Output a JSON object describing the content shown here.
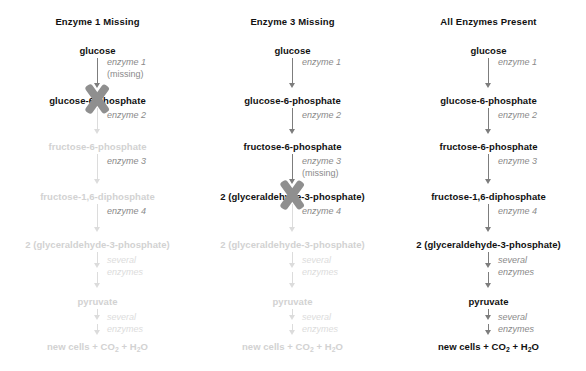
{
  "figure": {
    "background": "#ffffff",
    "active_color": "#111111",
    "faded_color": "#d2d2d2",
    "arrow_color": "#7d7d7d",
    "faded_arrow_color": "#dcdcdc",
    "x_mark_color": "#8f8f8f"
  },
  "columns": [
    {
      "title": "Enzyme 1 Missing",
      "blocked_at": "glucose-6-phosphate",
      "nodes": [
        {
          "label": "glucose",
          "faded": false
        },
        {
          "label": "glucose-6-phosphate",
          "faded": false,
          "x_mark": true
        },
        {
          "label": "fructose-6-phosphate",
          "faded": true
        },
        {
          "label": "fructose-1,6-diphosphate",
          "faded": true
        },
        {
          "label": "2 (glyceraldehyde-3-phosphate)",
          "faded": true
        },
        {
          "label": "pyruvate",
          "faded": true
        },
        {
          "label": "new cells + CO2 + H2O",
          "html": "new cells + CO<sub>2</sub> + H<sub>2</sub>O",
          "faded": true
        }
      ],
      "steps": [
        {
          "label": "enzyme 1",
          "second_line": "(missing)",
          "faded": false,
          "double": false
        },
        {
          "label": "enzyme 2",
          "second_line": "",
          "faded": false,
          "double": false,
          "arrow_faded": true
        },
        {
          "label": "enzyme 3",
          "second_line": "",
          "faded": false,
          "double": false,
          "arrow_faded": true
        },
        {
          "label": "enzyme 4",
          "second_line": "",
          "faded": false,
          "double": false,
          "arrow_faded": true
        },
        {
          "label": "several",
          "second_line": "enzymes",
          "faded": true,
          "double": true
        },
        {
          "label": "several",
          "second_line": "enzymes",
          "faded": true,
          "double": true
        }
      ]
    },
    {
      "title": "Enzyme 3 Missing",
      "blocked_at": "2 (glyceraldehyde-3-phosphate)",
      "nodes": [
        {
          "label": "glucose",
          "faded": false
        },
        {
          "label": "glucose-6-phosphate",
          "faded": false
        },
        {
          "label": "fructose-6-phosphate",
          "faded": false
        },
        {
          "label": "2 (glyceraldehyde-3-phosphate)",
          "faded": false,
          "x_mark": true
        },
        {
          "label": "2 (glyceraldehyde-3-phosphate)",
          "faded": true
        },
        {
          "label": "pyruvate",
          "faded": true
        },
        {
          "label": "new cells + CO2 + H2O",
          "html": "new cells + CO<sub>2</sub> + H<sub>2</sub>O",
          "faded": true
        }
      ],
      "steps": [
        {
          "label": "enzyme 1",
          "second_line": "",
          "faded": false,
          "double": false
        },
        {
          "label": "enzyme 2",
          "second_line": "",
          "faded": false,
          "double": false
        },
        {
          "label": "enzyme 3",
          "second_line": "(missing)",
          "faded": false,
          "double": false
        },
        {
          "label": "enzyme 4",
          "second_line": "",
          "faded": false,
          "double": false,
          "arrow_faded": true
        },
        {
          "label": "several",
          "second_line": "enzymes",
          "faded": true,
          "double": true
        },
        {
          "label": "several",
          "second_line": "enzymes",
          "faded": true,
          "double": true
        }
      ]
    },
    {
      "title": "All Enzymes Present",
      "blocked_at": "",
      "nodes": [
        {
          "label": "glucose",
          "faded": false
        },
        {
          "label": "glucose-6-phosphate",
          "faded": false
        },
        {
          "label": "fructose-6-phosphate",
          "faded": false
        },
        {
          "label": "fructose-1,6-diphosphate",
          "faded": false
        },
        {
          "label": "2 (glyceraldehyde-3-phosphate)",
          "faded": false
        },
        {
          "label": "pyruvate",
          "faded": false
        },
        {
          "label": "new cells + CO2 + H2O",
          "html": "new cells + CO<sub>2</sub> + H<sub>2</sub>O",
          "faded": false
        }
      ],
      "steps": [
        {
          "label": "enzyme 1",
          "second_line": "",
          "faded": false,
          "double": false
        },
        {
          "label": "enzyme 2",
          "second_line": "",
          "faded": false,
          "double": false
        },
        {
          "label": "enzyme 3",
          "second_line": "",
          "faded": false,
          "double": false
        },
        {
          "label": "enzyme 4",
          "second_line": "",
          "faded": false,
          "double": false
        },
        {
          "label": "several",
          "second_line": "enzymes",
          "faded": false,
          "double": true
        },
        {
          "label": "several",
          "second_line": "enzymes",
          "faded": false,
          "double": true
        }
      ]
    }
  ]
}
